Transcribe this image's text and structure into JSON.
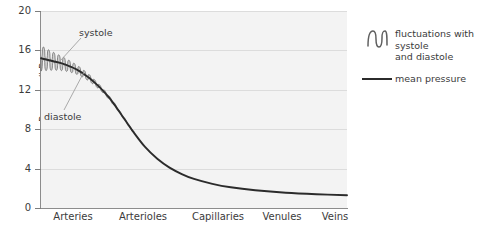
{
  "chart_data": {
    "type": "line",
    "title": "",
    "xlabel": "",
    "ylabel": "Pressure/kPa",
    "ylim": [
      0,
      20
    ],
    "yticks": [
      0,
      4,
      8,
      12,
      16,
      20
    ],
    "ytick_labels": [
      "0",
      "4",
      "8",
      "12",
      "16",
      "20"
    ],
    "categories": [
      "Arteries",
      "Arterioles",
      "Capillaries",
      "Venules",
      "Veins"
    ],
    "grid": "horizontal",
    "legend_position": "right",
    "series": [
      {
        "name": "mean pressure",
        "color": "#2b2b2b",
        "x": [
          0,
          2,
          4,
          6,
          8,
          10,
          12,
          14,
          16,
          18,
          20,
          22,
          24,
          26,
          28,
          30,
          34,
          38,
          42,
          46,
          50,
          56,
          62,
          70,
          80,
          90,
          100
        ],
        "values": [
          15.2,
          15.05,
          14.9,
          14.75,
          14.55,
          14.3,
          14.0,
          13.6,
          13.15,
          12.6,
          12.0,
          11.3,
          10.5,
          9.6,
          8.7,
          7.8,
          6.2,
          5.0,
          4.1,
          3.45,
          2.95,
          2.45,
          2.1,
          1.8,
          1.55,
          1.4,
          1.3
        ]
      },
      {
        "name": "fluctuations with systole and diastole",
        "color": "#5f5f5f",
        "description": "oscillating band superimposed on the mean pressure line from the arteries through the arterioles, amplitude decaying from about 1.3 kPa to 0",
        "x_start": 0,
        "x_end": 30,
        "systole_start": 16.4,
        "diastole_start": 14.0,
        "amplitude_start": 1.3,
        "amplitude_end": 0.1,
        "cycles": 18
      }
    ],
    "annotations": [
      {
        "label": "systole",
        "target_x": 6,
        "target_y": 15.6
      },
      {
        "label": "diastole",
        "target_x": 12,
        "target_y": 13.0
      }
    ]
  },
  "axis": {
    "y_title": "Pressure/kPa",
    "y_ticks": [
      "20",
      "16",
      "12",
      "8",
      "4",
      "0"
    ],
    "x_ticks": [
      "Arteries",
      "Arterioles",
      "Capillaries",
      "Venules",
      "Veins"
    ]
  },
  "annotations": {
    "systole": "systole",
    "diastole": "diastole"
  },
  "legend": {
    "fluctuations_line1": "fluctuations with systole",
    "fluctuations_line2": "and diastole",
    "mean": "mean pressure"
  },
  "colors": {
    "plot_background": "#f3f3f3",
    "gridline": "#dcdcdc",
    "axis": "#8c8c8c",
    "mean_line": "#2b2b2b",
    "fluctuation": "#5f5f5f",
    "text": "#3b3b3b",
    "leader": "#9a9a9a"
  }
}
